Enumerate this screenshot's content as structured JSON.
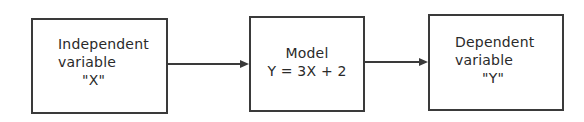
{
  "diagram": {
    "type": "flow",
    "nodes": [
      {
        "id": "input",
        "lines": [
          "Independent",
          "variable",
          "\"X\""
        ]
      },
      {
        "id": "model",
        "lines": [
          "Model",
          "Y = 3X + 2"
        ]
      },
      {
        "id": "output",
        "lines": [
          "Dependent",
          "variable",
          "\"Y\""
        ]
      }
    ],
    "edges": [
      {
        "from": "input",
        "to": "model"
      },
      {
        "from": "model",
        "to": "output"
      }
    ]
  }
}
